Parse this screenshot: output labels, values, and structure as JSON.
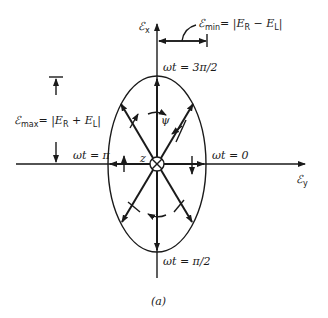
{
  "figure": {
    "caption": "(a)",
    "axes": {
      "x_axis_label": "ℰ",
      "x_axis_sub": "x",
      "y_axis_label": "ℰ",
      "y_axis_sub": "y"
    },
    "phase_labels": {
      "top": "ωt = 3π/2",
      "bottom": "ωt = π/2",
      "left": "ωt = π",
      "right": "ωt = 0"
    },
    "annotations": {
      "min_label": "ℰ",
      "min_sub": "min",
      "min_expr": "= |E",
      "min_R": "R",
      "min_minus": " − E",
      "min_L": "L",
      "min_close": "|",
      "max_label": "ℰ",
      "max_sub": "max",
      "max_expr": "= |E",
      "max_R": "R",
      "max_plus": " + E",
      "max_L": "L",
      "max_close": "|",
      "psi": "ψ",
      "z": "z"
    }
  }
}
